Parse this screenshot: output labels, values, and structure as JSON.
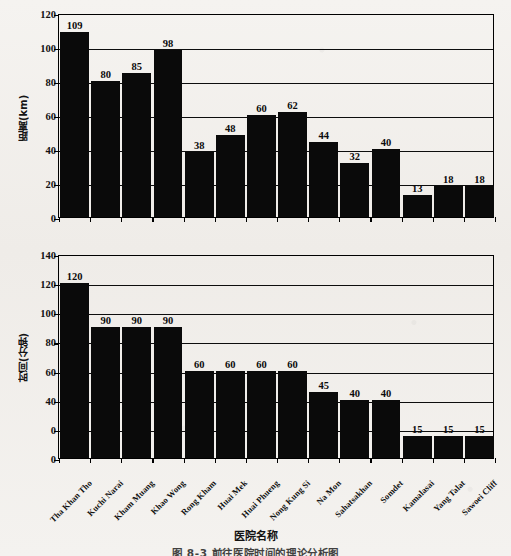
{
  "figure": {
    "xaxis_title": "医院名称",
    "caption": "图 8-3  前往医院时间的理论分析图"
  },
  "chart_data": [
    {
      "type": "bar",
      "title": "",
      "ylabel": "距离(km)",
      "xlabel": "医院名称",
      "ylim": [
        0,
        120
      ],
      "yticks": [
        "120",
        "100",
        "80",
        "60",
        "40",
        "20",
        "0"
      ],
      "ytick_values": [
        120,
        100,
        80,
        60,
        40,
        20,
        0
      ],
      "grid": true,
      "legend": "none",
      "categories": [
        "Tha Khan Tho",
        "Kuchi Narai",
        "Kham Muang",
        "Khao Wong",
        "Rong Kham",
        "Huai Mek",
        "Huai Phueng",
        "Nong Kung Si",
        "Na Mon",
        "Sahatsakhan",
        "Somdet",
        "Kamalasai",
        "Yang Talat",
        "Sawoei Cliff"
      ],
      "values": [
        109,
        80,
        85,
        98,
        38,
        48,
        60,
        62,
        44,
        32,
        40,
        13,
        18,
        18
      ],
      "bar_color": "#0a0a0a"
    },
    {
      "type": "bar",
      "title": "",
      "ylabel": "时间(分钟)",
      "xlabel": "医院名称",
      "ylim": [
        0,
        140
      ],
      "yticks": [
        "140",
        "120",
        "100",
        "80",
        "60",
        "40",
        "0",
        "0"
      ],
      "ytick_values": [
        140,
        120,
        100,
        80,
        60,
        40,
        20,
        0
      ],
      "grid": true,
      "legend": "none",
      "categories": [
        "Tha Khan Tho",
        "Kuchi Narai",
        "Kham Muang",
        "Khao Wong",
        "Rong Kham",
        "Huai Mek",
        "Huai Phueng",
        "Nong Kung Si",
        "Na Mon",
        "Sahatsakhan",
        "Somdet",
        "Kamalasai",
        "Yang Talat",
        "Sawoei Cliff"
      ],
      "values": [
        120,
        90,
        90,
        90,
        60,
        60,
        60,
        60,
        45,
        40,
        40,
        15,
        15,
        15
      ],
      "bar_color": "#0a0a0a"
    }
  ]
}
